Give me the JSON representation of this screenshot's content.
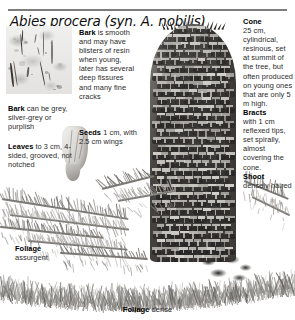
{
  "title": "Abies procera (syn. A. nobilis)",
  "labels": {
    "bark_top": {
      "lead": "Bark",
      "text": " is smooth and may have blisters of resin when young, later has several deep fissures and many fine cracks"
    },
    "seeds": {
      "lead": "Seeds",
      "text": " 1 cm, with 2.5 cm wings"
    },
    "bark_left": {
      "lead": "Bark",
      "text": " can be grey, silver-grey or purplish"
    },
    "leaves": {
      "lead": "Leaves",
      "text": " to 3 cm, 4-sided, grooved, not notched"
    },
    "cone": {
      "lead": "Cone",
      "text": "25 cm, cylindrical, resinous, set at summit of the tree, but often produced on young ones that are only 5 m high."
    },
    "bracts": {
      "lead": "Bracts",
      "text": "with 1 cm reflexed tips, set spirally, almost covering the cone."
    },
    "shoot": {
      "lead": "Shoot",
      "text": "densely haired"
    },
    "foliage_assurgent": {
      "lead": "Foliage",
      "text": "assurgent"
    },
    "foliage_dense": {
      "lead": "Foliage",
      "text": " dense"
    }
  },
  "illustrations": {
    "bark_inset": "bark-texture-illustration",
    "cone": "noble-fir-cone-illustration",
    "seed": "winged-seed-illustration",
    "foliage_sprays": "conifer-foliage-illustration",
    "foliage_band": "dense-foliage-band-illustration",
    "shoot_mass": "densely-haired-shoot-illustration"
  },
  "colors": {
    "rule": "#7d7d7d",
    "cone_dark": "#413e3b",
    "cone_scale": "#d9d7d2",
    "text": "#2a2a2a",
    "heading": "#000000",
    "background": "#ffffff"
  }
}
